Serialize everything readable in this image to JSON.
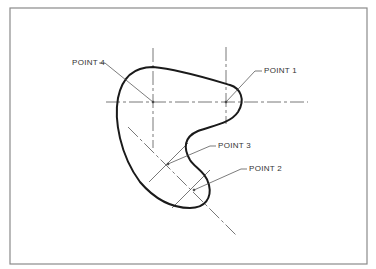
{
  "diagram": {
    "type": "technical-drawing",
    "colors": {
      "background": "#ffffff",
      "border": "#8a8a8a",
      "profile": "#1a1a1a",
      "centerline": "#555555",
      "leader": "#555555",
      "text": "#333333"
    },
    "labels": {
      "point1": "POINT 1",
      "point2": "POINT 2",
      "point3": "POINT 3",
      "point4": "POINT 4"
    },
    "points": [
      {
        "name": "POINT 1",
        "cx": 226,
        "cy": 102
      },
      {
        "name": "POINT 2",
        "cx": 193,
        "cy": 190
      },
      {
        "name": "POINT 3",
        "cx": 167,
        "cy": 164
      },
      {
        "name": "POINT 4",
        "cx": 153,
        "cy": 102
      }
    ]
  }
}
